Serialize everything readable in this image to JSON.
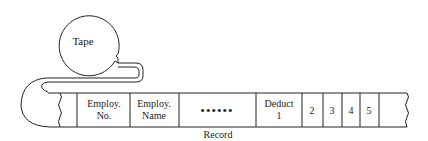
{
  "diagram": {
    "tape_label": "Tape",
    "record_label": "Record",
    "fields": [
      {
        "line1": "Employ.",
        "line2": "No."
      },
      {
        "line1": "Employ.",
        "line2": "Name"
      },
      {
        "line1": "••••••",
        "line2": ""
      },
      {
        "line1": "Deduct",
        "line2": "1"
      },
      {
        "line1": "2",
        "line2": ""
      },
      {
        "line1": "3",
        "line2": ""
      },
      {
        "line1": "4",
        "line2": ""
      },
      {
        "line1": "5",
        "line2": ""
      }
    ],
    "stroke_color": "#222222"
  }
}
